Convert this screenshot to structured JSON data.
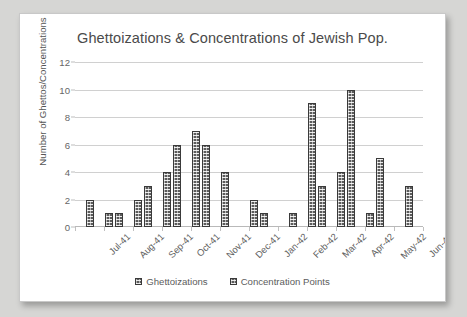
{
  "chart_data": {
    "type": "bar",
    "title": "Ghettoizations & Concentrations of Jewish Pop.",
    "xlabel": "",
    "ylabel": "Number of Ghettos/Concentrations",
    "ylim": [
      0,
      12
    ],
    "ytick_step": 2,
    "yticks": [
      0,
      2,
      4,
      6,
      8,
      10,
      12
    ],
    "grid": true,
    "legend_position": "bottom",
    "categories": [
      "Jul-41",
      "Aug-41",
      "Sep-41",
      "Oct-41",
      "Nov-41",
      "Dec-41",
      "Jan-42",
      "Feb-42",
      "Mar-42",
      "Apr-42",
      "May-42",
      "Jun-42"
    ],
    "series": [
      {
        "name": "Ghettoizations",
        "color": "#5b5b5b",
        "values": [
          0,
          1,
          2,
          4,
          7,
          4,
          2,
          0,
          9,
          4,
          1,
          0
        ]
      },
      {
        "name": "Concentration Points",
        "color": "#5b5b5b",
        "values": [
          2,
          1,
          3,
          6,
          6,
          0,
          1,
          1,
          3,
          10,
          5,
          3
        ]
      }
    ]
  },
  "legend": {
    "items": [
      {
        "label": "Ghettoizations"
      },
      {
        "label": "Concentration Points"
      }
    ]
  }
}
